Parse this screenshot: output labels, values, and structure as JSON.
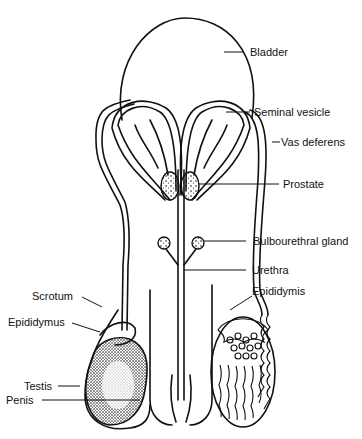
{
  "figure": {
    "type": "anatomical line drawing"
  },
  "labels": {
    "bladder": "Bladder",
    "seminal_vesicle": "Seminal vesicle",
    "vas_deferens": "Vas deferens",
    "prostate": "Prostate",
    "bulbourethral_gland": "Bulbourethral gland",
    "urethra": "Urethra",
    "epididymis_right": "Epididymis",
    "scrotum": "Scrotum",
    "epididymus_left": "Epididymus",
    "testis": "Testis",
    "penis": "Penis"
  },
  "colors": {
    "ink": "#111111",
    "background": "#ffffff"
  }
}
